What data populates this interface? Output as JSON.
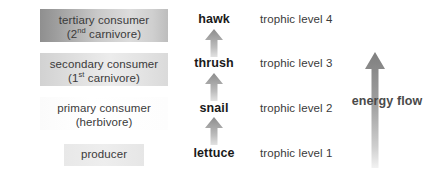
{
  "roles": [
    {
      "id": "tertiary",
      "line1": "tertiary consumer",
      "line2_pre": "(2",
      "line2_sup": "nd",
      "line2_post": " carnivore)"
    },
    {
      "id": "secondary",
      "line1": "secondary consumer",
      "line2_pre": "(1",
      "line2_sup": "st",
      "line2_post": " carnivore)"
    },
    {
      "id": "primary",
      "line1": "primary consumer",
      "line2_pre": "(herbivore)",
      "line2_sup": "",
      "line2_post": ""
    },
    {
      "id": "producer",
      "line1": "producer",
      "line2_pre": "",
      "line2_sup": "",
      "line2_post": ""
    }
  ],
  "organisms": [
    {
      "id": "hawk",
      "name": "hawk"
    },
    {
      "id": "thrush",
      "name": "thrush"
    },
    {
      "id": "snail",
      "name": "snail"
    },
    {
      "id": "lettuce",
      "name": "lettuce"
    }
  ],
  "trophic_levels": [
    {
      "id": "level4",
      "label": "trophic level 4"
    },
    {
      "id": "level3",
      "label": "trophic level 3"
    },
    {
      "id": "level2",
      "label": "trophic level 2"
    },
    {
      "id": "level1",
      "label": "trophic level 1"
    }
  ],
  "energy_flow": {
    "label": "energy flow",
    "direction": "upward"
  },
  "colors": {
    "background": "#ffffff",
    "box_text": "#3a3a3a",
    "organism_text": "#1a1a1a",
    "arrow_gray": "#8c8c8c",
    "arrow_light": "#d8d8d8",
    "tertiary_box_dark": "#8f8f8f",
    "tertiary_box_light": "#dcdcdc",
    "secondary_box": "#e3e3e3",
    "primary_box": "#fcfcfc",
    "producer_box": "#eaeaea"
  }
}
